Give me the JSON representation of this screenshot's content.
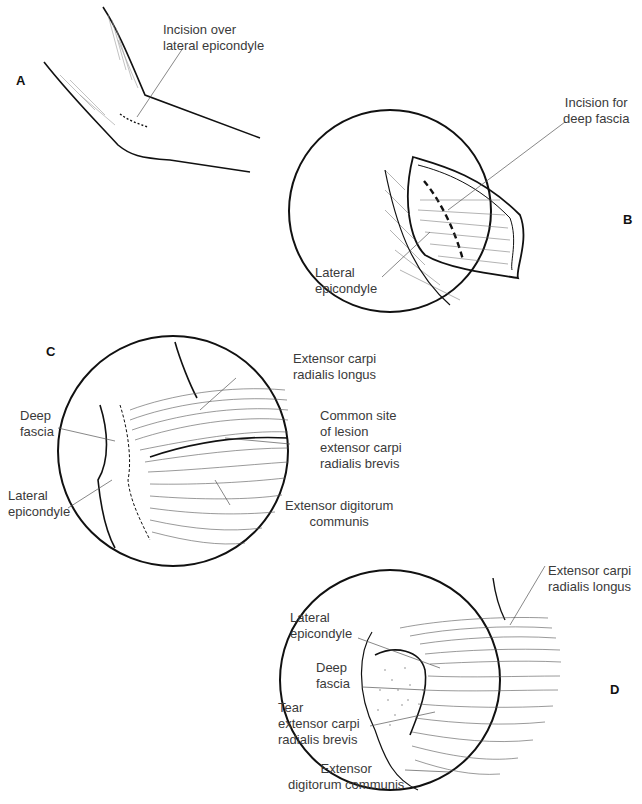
{
  "figure": {
    "panels": {
      "A": {
        "letter": "A",
        "labels": {
          "incision": "Incision over\nlateral epicondyle"
        }
      },
      "B": {
        "letter": "B",
        "labels": {
          "incision_fascia": "Incision for\ndeep fascia",
          "lateral_epicondyle": "Lateral\nepicondyle"
        }
      },
      "C": {
        "letter": "C",
        "labels": {
          "ecrl": "Extensor carpi\nradialis longus",
          "deep_fascia": "Deep\nfascia",
          "lesion_site": "Common site\nof lesion\nextensor carpi\nradialis brevis",
          "lateral_epicondyle": "Lateral\nepicondyle",
          "edc": "Extensor digitorum\ncommunis"
        }
      },
      "D": {
        "letter": "D",
        "labels": {
          "ecrl": "Extensor carpi\nradialis longus",
          "lateral_epicondyle": "Lateral\nepicondyle",
          "deep_fascia": "Deep\nfascia",
          "tear": "Tear\nextensor carpi\nradialis brevis",
          "edc": "Extensor\ndigitorum communis"
        }
      }
    },
    "colors": {
      "ink": "#111111",
      "label": "#3a3a3a",
      "leader": "#555555",
      "background": "#ffffff"
    }
  }
}
